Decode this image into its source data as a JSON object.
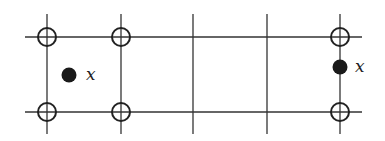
{
  "diagram": {
    "colors": {
      "line": "#333333",
      "circle_stroke": "#222222",
      "filled_point": "#1a1a1a",
      "background": "#ffffff"
    },
    "grid": {
      "vertical_lines_x": [
        47,
        121,
        193,
        267,
        340
      ],
      "horizontal_lines_y": [
        37,
        112
      ],
      "vertical_extent": [
        14,
        134
      ],
      "horizontal_extent": [
        25,
        362
      ]
    },
    "open_circles": [
      {
        "cx": 47,
        "cy": 37
      },
      {
        "cx": 121,
        "cy": 37
      },
      {
        "cx": 47,
        "cy": 112
      },
      {
        "cx": 121,
        "cy": 112
      },
      {
        "cx": 340,
        "cy": 37
      },
      {
        "cx": 340,
        "cy": 112
      }
    ],
    "filled_points": [
      {
        "cx": 69,
        "cy": 75,
        "label": "x",
        "label_x": 86,
        "label_y": 80
      },
      {
        "cx": 340,
        "cy": 67,
        "label": "x",
        "label_x": 355,
        "label_y": 72
      }
    ]
  }
}
